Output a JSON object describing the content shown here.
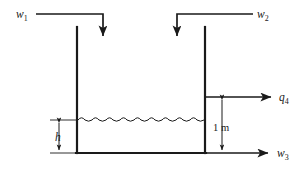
{
  "figure": {
    "background_color": "#ffffff",
    "line_color": "#1a1a1a"
  },
  "labels": {
    "inlet_1": {
      "symbol": "w",
      "subscript": "1",
      "text": "w1"
    },
    "inlet_2": {
      "symbol": "w",
      "subscript": "2",
      "text": "w2"
    },
    "outlet_bottom": {
      "symbol": "w",
      "subscript": "3",
      "text": "w3"
    },
    "outlet_side": {
      "symbol": "q",
      "subscript": "4",
      "text": "q4"
    },
    "liquid_level": {
      "symbol": "h",
      "subscript": "",
      "text": "h"
    },
    "side_outlet_height": {
      "symbol": "",
      "subscript": "",
      "text": "1 m"
    }
  },
  "geometry": {
    "tank_left_x": 77,
    "tank_right_x": 205,
    "tank_top_y": 27,
    "tank_bottom_y": 153,
    "water_surface_y": 120,
    "side_outlet_y": 97,
    "inlet_line_y": 14,
    "inlet1_arrow_x": 103,
    "inlet1_arrow_tip_y": 40,
    "inlet1_line_start_x": 36,
    "inlet2_arrow_x": 177,
    "inlet2_arrow_tip_y": 40,
    "inlet2_line_end_x": 253,
    "outlet_arrow_tip_x": 274,
    "h_dim_x": 59,
    "h_tick_left_x": 50,
    "m_dim_x": 222,
    "wave_amplitude": 2,
    "wave_period": 7
  },
  "annotations": {
    "water_surface_style": "wavy-line",
    "dimension_style": "double-headed-arrow"
  }
}
